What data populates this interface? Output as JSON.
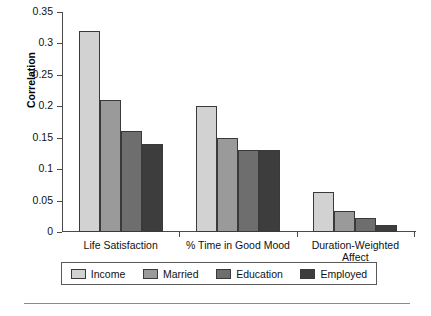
{
  "chart_data": {
    "type": "bar",
    "title": "",
    "subtitle": "",
    "xlabel": "",
    "ylabel": "Correlation",
    "categories": [
      "Life Satisfaction",
      "% Time in Good Mood",
      "Duration-Weighted\nAffect"
    ],
    "series": [
      {
        "name": "Income",
        "color": "#d2d2d2",
        "values": [
          0.32,
          0.2,
          0.063
        ]
      },
      {
        "name": "Married",
        "color": "#9a9a9a",
        "values": [
          0.21,
          0.15,
          0.033
        ]
      },
      {
        "name": "Education",
        "color": "#6e6e6e",
        "values": [
          0.16,
          0.13,
          0.022
        ]
      },
      {
        "name": "Employed",
        "color": "#3d3d3d",
        "values": [
          0.14,
          0.13,
          0.011
        ]
      }
    ],
    "ylim": [
      0,
      0.35
    ],
    "yticks": [
      "0",
      "0.05",
      "0.1",
      "0.15",
      "0.2",
      "0.25",
      "0.3",
      "0.35"
    ],
    "ytick_values": [
      0,
      0.05,
      0.1,
      0.15,
      0.2,
      0.25,
      0.3,
      0.35
    ],
    "grid": false,
    "legend_position": "bottom",
    "legend_entries": [
      "Income",
      "Married",
      "Education",
      "Employed"
    ]
  },
  "axis": {
    "y_title": "Correlation"
  },
  "colors": {
    "income": "#d2d2d2",
    "married": "#9a9a9a",
    "education": "#6e6e6e",
    "employed": "#3d3d3d",
    "axis": "#4a4a4a",
    "bar_outline": "#3a3a3a"
  }
}
